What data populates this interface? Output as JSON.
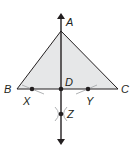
{
  "figure": {
    "colors": {
      "stroke": "#231f20",
      "fill": "#e6e7e8",
      "arc": "#a7a9ac"
    },
    "points": {
      "A": {
        "label": "A",
        "x": 61,
        "y": 31
      },
      "B": {
        "label": "B",
        "x": 17,
        "y": 89
      },
      "C": {
        "label": "C",
        "x": 118,
        "y": 89
      },
      "D": {
        "label": "D",
        "x": 61,
        "y": 89
      },
      "X": {
        "label": "X",
        "x": 32,
        "y": 89
      },
      "Y": {
        "label": "Y",
        "x": 88,
        "y": 89
      },
      "Z": {
        "label": "Z",
        "x": 61,
        "y": 114
      }
    },
    "line": {
      "name": "perpendicular line AZ",
      "arrows": "both ends"
    }
  }
}
